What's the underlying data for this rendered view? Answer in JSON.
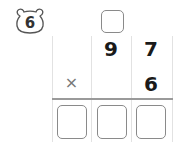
{
  "problem": {
    "number": "6",
    "number_icon": "bear-face-icon"
  },
  "multiplication": {
    "carry_box": "",
    "multiplicand": {
      "tens": "9",
      "ones": "7"
    },
    "operator": "×",
    "multiplier": {
      "ones": "6"
    },
    "answer_boxes": [
      "",
      "",
      ""
    ]
  },
  "colors": {
    "box_border": "#8a8a8a",
    "grid_line": "#e2e2e2",
    "rule_line": "#9a9a9a",
    "digit": "#1a1a1a"
  }
}
